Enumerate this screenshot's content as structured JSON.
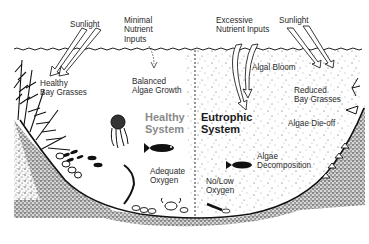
{
  "diagram": {
    "healthy_system": {
      "title_line1": "Healthy",
      "title_line2": "System",
      "labels": {
        "sunlight": "Sunlight",
        "minimal_nutrient_1": "Minimal",
        "minimal_nutrient_2": "Nutrient",
        "minimal_nutrient_3": "Inputs",
        "bay_grasses_1": "Healthy",
        "bay_grasses_2": "Bay Grasses",
        "algae_growth_1": "Balanced",
        "algae_growth_2": "Algae Growth",
        "oxygen_1": "Adequate",
        "oxygen_2": "Oxygen"
      }
    },
    "eutrophic_system": {
      "title_line1": "Eutrophic",
      "title_line2": "System",
      "labels": {
        "excessive_nutrient_1": "Excessive",
        "excessive_nutrient_2": "Nutrient Inputs",
        "sunlight": "Sunlight",
        "algal_bloom": "Algal Bloom",
        "reduced_grasses_1": "Reduced",
        "reduced_grasses_2": "Bay Grasses",
        "algae_dieoff": "Algae Die-off",
        "decomposition_1": "Algae",
        "decomposition_2": "Decomposition",
        "oxygen_1": "No/Low",
        "oxygen_2": "Oxygen"
      }
    },
    "colors": {
      "ink": "#1a1a1a",
      "sediment": "#9a9a9a",
      "healthy_title": "#8a8a8a",
      "background": "#ffffff"
    }
  }
}
